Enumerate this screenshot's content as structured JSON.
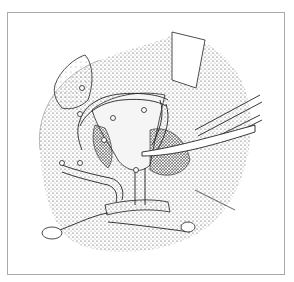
{
  "figure": {
    "type": "medical-illustration",
    "style": "stipple pen-and-ink",
    "frame_color": "#a9a9a9",
    "background": "#ffffff",
    "ink_color": "#1a1a1a"
  }
}
